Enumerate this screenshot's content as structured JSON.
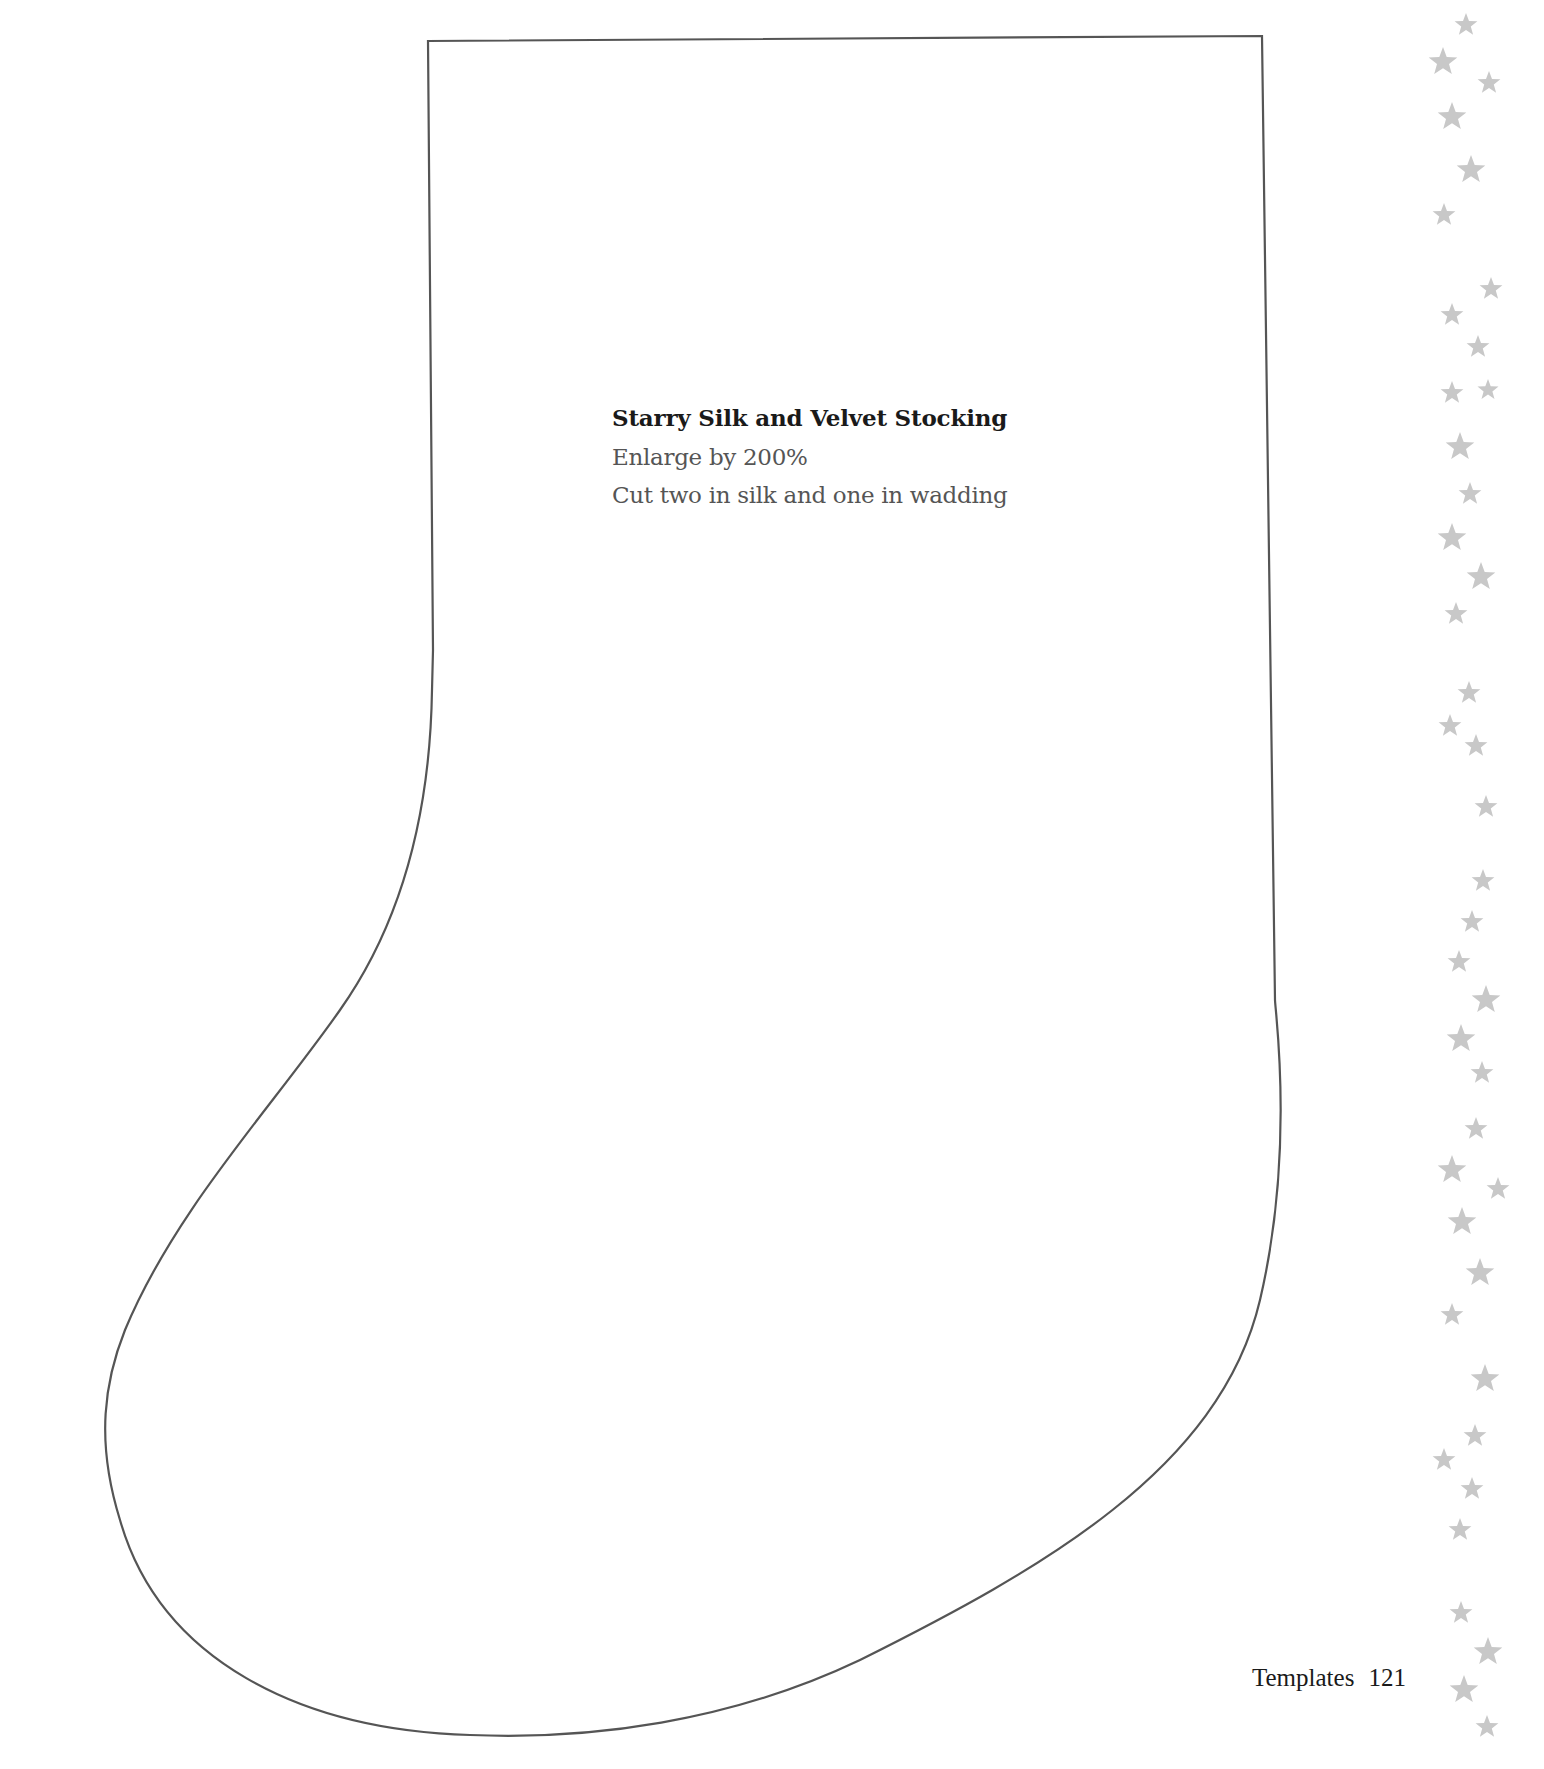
{
  "template": {
    "title": "Starry Silk and Velvet Stocking",
    "instructions": [
      "Enlarge by 200%",
      "Cut two in silk and one in wadding"
    ]
  },
  "footer": {
    "section": "Templates",
    "page_number": "121"
  },
  "colors": {
    "outline": "#555555",
    "star": "#c8c8c8",
    "title_text": "#1a1a1a",
    "body_text": "#555555"
  },
  "decoration": {
    "stars": [
      {
        "x": 1466,
        "y": 25,
        "r": 12
      },
      {
        "x": 1443,
        "y": 62,
        "r": 15
      },
      {
        "x": 1489,
        "y": 83,
        "r": 12
      },
      {
        "x": 1452,
        "y": 117,
        "r": 15
      },
      {
        "x": 1471,
        "y": 170,
        "r": 15
      },
      {
        "x": 1444,
        "y": 215,
        "r": 12
      },
      {
        "x": 1491,
        "y": 289,
        "r": 12
      },
      {
        "x": 1452,
        "y": 315,
        "r": 12
      },
      {
        "x": 1478,
        "y": 347,
        "r": 12
      },
      {
        "x": 1452,
        "y": 393,
        "r": 12
      },
      {
        "x": 1488,
        "y": 390,
        "r": 11
      },
      {
        "x": 1460,
        "y": 447,
        "r": 15
      },
      {
        "x": 1470,
        "y": 494,
        "r": 12
      },
      {
        "x": 1452,
        "y": 538,
        "r": 15
      },
      {
        "x": 1481,
        "y": 577,
        "r": 15
      },
      {
        "x": 1456,
        "y": 614,
        "r": 12
      },
      {
        "x": 1469,
        "y": 693,
        "r": 12
      },
      {
        "x": 1450,
        "y": 726,
        "r": 12
      },
      {
        "x": 1476,
        "y": 746,
        "r": 12
      },
      {
        "x": 1486,
        "y": 807,
        "r": 12
      },
      {
        "x": 1483,
        "y": 881,
        "r": 12
      },
      {
        "x": 1472,
        "y": 922,
        "r": 12
      },
      {
        "x": 1459,
        "y": 962,
        "r": 12
      },
      {
        "x": 1486,
        "y": 1000,
        "r": 15
      },
      {
        "x": 1461,
        "y": 1039,
        "r": 15
      },
      {
        "x": 1482,
        "y": 1073,
        "r": 12
      },
      {
        "x": 1476,
        "y": 1129,
        "r": 12
      },
      {
        "x": 1452,
        "y": 1170,
        "r": 15
      },
      {
        "x": 1498,
        "y": 1189,
        "r": 12
      },
      {
        "x": 1462,
        "y": 1222,
        "r": 15
      },
      {
        "x": 1480,
        "y": 1273,
        "r": 15
      },
      {
        "x": 1452,
        "y": 1315,
        "r": 12
      },
      {
        "x": 1485,
        "y": 1379,
        "r": 15
      },
      {
        "x": 1475,
        "y": 1436,
        "r": 12
      },
      {
        "x": 1444,
        "y": 1460,
        "r": 12
      },
      {
        "x": 1472,
        "y": 1489,
        "r": 12
      },
      {
        "x": 1460,
        "y": 1530,
        "r": 12
      },
      {
        "x": 1461,
        "y": 1613,
        "r": 12
      },
      {
        "x": 1488,
        "y": 1652,
        "r": 15
      },
      {
        "x": 1464,
        "y": 1690,
        "r": 15
      },
      {
        "x": 1487,
        "y": 1727,
        "r": 12
      }
    ]
  }
}
